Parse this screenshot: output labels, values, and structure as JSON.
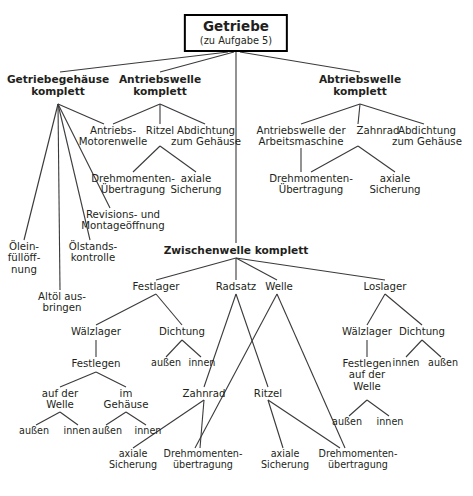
{
  "diagram": {
    "type": "function-structure-tree",
    "language": "de",
    "root": {
      "title": "Getriebe",
      "subtitle": "(zu Aufgabe 5)"
    },
    "nodes": {
      "getriebegehaeuse": "Getriebegehäuse\nkomplett",
      "antriebswelle": "Antriebswelle\nkomplett",
      "abtriebswelle": "Abtriebswelle\nkomplett",
      "zwischenwelle": "Zwischenwelle komplett",
      "antriebs_motorenwelle": "Antriebs-\nMotorenwelle",
      "ritzel_a": "Ritzel",
      "abdichtung_a": "Abdichtung\nzum Gehäuse",
      "drehmoment_a": "Drehmomenten-\nÜbertragung",
      "axiale_a": "axiale\nSicherung",
      "oeleinfuell": "Ölein-\nfüllöff-\nnung",
      "oelstand": "Ölstands-\nkontrolle",
      "revisions": "Revisions- und\nMontageöffnung",
      "altoel": "Altöl aus-\nbringen",
      "antriebswelle_arbeitsmaschine": "Antriebswelle der\nArbeitsmaschine",
      "zahnrad_b": "Zahnrad",
      "abdichtung_b": "Abdichtung\nzum Gehäuse",
      "drehmoment_b": "Drehmomenten-\nÜbertragung",
      "axiale_b": "axiale\nSicherung",
      "festlager": "Festlager",
      "radsatz": "Radsatz",
      "welle": "Welle",
      "loslager": "Loslager",
      "waelzlager_l": "Wälzlager",
      "dichtung_l": "Dichtung",
      "dichtung_l_aussen": "außen",
      "dichtung_l_innen": "innen",
      "festlegen_l": "Festlegen",
      "auf_der_welle": "auf der\nWelle",
      "im_gehaeuse": "im\nGehäuse",
      "adw_aussen": "außen",
      "adw_innen": "innen",
      "ig_aussen": "außen",
      "ig_innen": "innen",
      "zahnrad_c": "Zahnrad",
      "ritzel_c": "Ritzel",
      "axiale_c1": "axiale\nSicherung",
      "drehmoment_c1": "Drehmomenten-\nübertragung",
      "axiale_c2": "axiale\nSicherung",
      "drehmoment_c2": "Drehmomenten-\nübertragung",
      "waelzlager_r": "Wälzlager",
      "dichtung_r": "Dichtung",
      "dichtung_r_innen": "innen",
      "dichtung_r_aussen": "außen",
      "festlegen_r": "Festlegen\nauf der\nWelle",
      "fr_aussen": "außen",
      "fr_innen": "innen"
    },
    "colors": {
      "text": "#231f20",
      "edge": "#3a3a3a",
      "box_border": "#000000",
      "background": "#ffffff"
    }
  }
}
